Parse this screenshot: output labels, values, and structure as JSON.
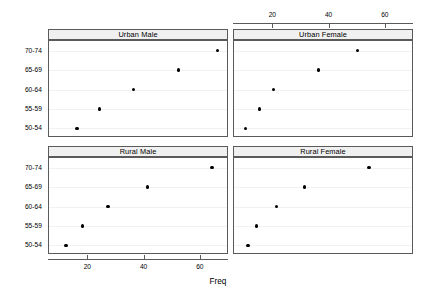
{
  "chart_data": {
    "type": "scatter",
    "title": "",
    "xlabel": "Freq",
    "ylabel": "",
    "xlim": [
      6,
      70
    ],
    "xticks": [
      20,
      40,
      60
    ],
    "categories": [
      "50-54",
      "55-59",
      "60-64",
      "65-69",
      "70-74"
    ],
    "grid": false,
    "legend": "none",
    "panel_layout": {
      "rows": 2,
      "cols": 2
    },
    "panels": [
      {
        "label": "Urban Male",
        "row": 0,
        "col": 0,
        "x_axis_side": "bottom",
        "points": [
          {
            "category": "50-54",
            "value": 16
          },
          {
            "category": "55-59",
            "value": 24
          },
          {
            "category": "60-64",
            "value": 36
          },
          {
            "category": "65-69",
            "value": 52
          },
          {
            "category": "70-74",
            "value": 66
          }
        ]
      },
      {
        "label": "Urban Female",
        "row": 0,
        "col": 1,
        "x_axis_side": "top",
        "points": [
          {
            "category": "50-54",
            "value": 10
          },
          {
            "category": "55-59",
            "value": 15
          },
          {
            "category": "60-64",
            "value": 20
          },
          {
            "category": "65-69",
            "value": 36
          },
          {
            "category": "70-74",
            "value": 50
          }
        ]
      },
      {
        "label": "Rural Male",
        "row": 1,
        "col": 0,
        "x_axis_side": "bottom",
        "points": [
          {
            "category": "50-54",
            "value": 12
          },
          {
            "category": "55-59",
            "value": 18
          },
          {
            "category": "60-64",
            "value": 27
          },
          {
            "category": "65-69",
            "value": 41
          },
          {
            "category": "70-74",
            "value": 64
          }
        ]
      },
      {
        "label": "Rural Female",
        "row": 1,
        "col": 1,
        "x_axis_side": "top",
        "points": [
          {
            "category": "50-54",
            "value": 11
          },
          {
            "category": "55-59",
            "value": 14
          },
          {
            "category": "60-64",
            "value": 21
          },
          {
            "category": "65-69",
            "value": 31
          },
          {
            "category": "70-74",
            "value": 54
          }
        ]
      }
    ],
    "colors": {
      "point": "#000000",
      "panel_border": "#5a5a5a",
      "strip_background": "#f0f0f0",
      "background": "#ffffff"
    }
  }
}
